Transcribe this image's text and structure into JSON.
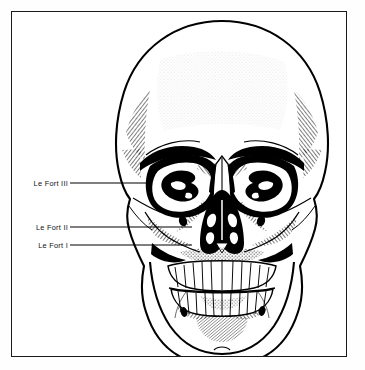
{
  "figure": {
    "view": "anterior skull",
    "style": "black and white line engraving with cross-hatch shading",
    "background_color": "#ffffff",
    "ink_color": "#000000",
    "frame": {
      "color": "#1a1a1a",
      "x": 11,
      "y": 11,
      "width": 336,
      "height": 346
    }
  },
  "callouts": [
    {
      "id": "le-fort-iii",
      "label": "Le Fort III",
      "label_x": 68,
      "label_y": 183,
      "leader_from_x": 70,
      "leader_to_x": 150,
      "leader_y": 183
    },
    {
      "id": "le-fort-ii",
      "label": "Le Fort II",
      "label_x": 68,
      "label_y": 227,
      "leader_from_x": 70,
      "leader_to_x": 192,
      "leader_y": 227
    },
    {
      "id": "le-fort-i",
      "label": "Le Fort I",
      "label_x": 68,
      "label_y": 245,
      "leader_from_x": 70,
      "leader_to_x": 192,
      "leader_y": 245
    }
  ],
  "anatomy": {
    "cranium": "frontal bone and calvaria",
    "orbits": "paired orbital rims with sphenoid and ethmoid detail",
    "nasal_aperture": "piriform aperture with vomer and turbinates",
    "maxilla": "upper jaw with alveolar process",
    "mandible": "lower jaw with mental foramina",
    "upper_teeth_count": 16,
    "lower_teeth_count": 16,
    "zygomatic_arches": "paired lateral cheek bones",
    "skull_bounds": {
      "x": 115,
      "y": 20,
      "width": 215,
      "height": 343
    }
  }
}
